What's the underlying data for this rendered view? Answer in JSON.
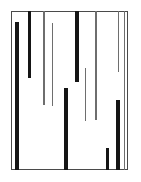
{
  "figure": {
    "kind": "abstract-bar-pattern",
    "canvas": {
      "width": 141,
      "height": 182,
      "background": "#ffffff"
    },
    "frame": {
      "name": "plot-frame",
      "x": 11,
      "y": 11,
      "width": 117,
      "height": 159,
      "stroke": "#4a4a4a",
      "stroke_width": 1,
      "fill": "#ffffff"
    },
    "colors": {
      "thick_bar": "#151515",
      "thin_bar": "#6e6e6e",
      "frame": "#4a4a4a",
      "background": "#ffffff"
    }
  },
  "chart_data": {
    "type": "bar",
    "title": "",
    "subtitle": "",
    "xlabel": "",
    "ylabel": "",
    "grid": false,
    "legend": null,
    "axis": {
      "xlim": [
        11,
        128
      ],
      "ylim": [
        11,
        170
      ]
    },
    "note": "Each datum is a vertical line segment: x = horizontal position (px), y0 = top end, y1 = bottom end, w = stroke width, weight = thick|thin",
    "categories": [
      "seg-1",
      "seg-2",
      "seg-3",
      "seg-4",
      "seg-5",
      "seg-6",
      "seg-7",
      "seg-8",
      "seg-9",
      "seg-10",
      "seg-11",
      "seg-12"
    ],
    "segments": [
      {
        "id": "seg-1",
        "x": 17,
        "y0": 22,
        "y1": 170,
        "w": 4,
        "weight": "thick",
        "length": 148
      },
      {
        "id": "seg-2",
        "x": 29,
        "y0": 11,
        "y1": 78,
        "w": 3,
        "weight": "thick",
        "length": 67
      },
      {
        "id": "seg-3",
        "x": 44,
        "y0": 11,
        "y1": 105,
        "w": 2,
        "weight": "thin",
        "length": 94
      },
      {
        "id": "seg-4",
        "x": 52,
        "y0": 23,
        "y1": 106,
        "w": 1,
        "weight": "thin",
        "length": 83
      },
      {
        "id": "seg-5",
        "x": 66,
        "y0": 88,
        "y1": 170,
        "w": 4,
        "weight": "thick",
        "length": 82
      },
      {
        "id": "seg-6",
        "x": 77,
        "y0": 11,
        "y1": 82,
        "w": 4,
        "weight": "thick",
        "length": 71
      },
      {
        "id": "seg-7",
        "x": 85,
        "y0": 68,
        "y1": 121,
        "w": 1,
        "weight": "thin",
        "length": 53
      },
      {
        "id": "seg-8",
        "x": 96,
        "y0": 11,
        "y1": 120,
        "w": 2,
        "weight": "thin",
        "length": 109
      },
      {
        "id": "seg-9",
        "x": 107,
        "y0": 148,
        "y1": 170,
        "w": 3,
        "weight": "thick",
        "length": 22
      },
      {
        "id": "seg-10",
        "x": 118,
        "y0": 11,
        "y1": 72,
        "w": 1,
        "weight": "thin",
        "length": 61
      },
      {
        "id": "seg-11",
        "x": 118,
        "y0": 100,
        "y1": 170,
        "w": 4,
        "weight": "thick",
        "length": 70
      },
      {
        "id": "seg-12",
        "x": 124,
        "y0": 11,
        "y1": 170,
        "w": 1,
        "weight": "thin",
        "length": 159
      }
    ],
    "values": [
      148,
      67,
      94,
      83,
      82,
      71,
      53,
      109,
      22,
      61,
      70,
      159
    ]
  }
}
